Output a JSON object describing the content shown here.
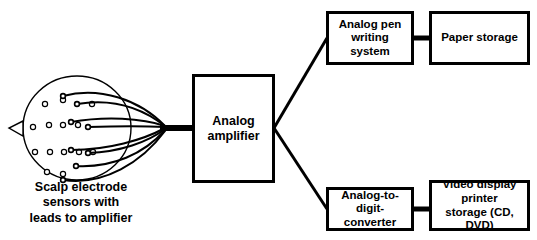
{
  "diagram": {
    "background_color": "#ffffff",
    "line_color": "#000000",
    "text_color": "#000000",
    "head": {
      "caption": "Scalp electrode\nsensors with\nleads to amplifier",
      "electrode_count": 14,
      "lead_count": 8,
      "nose_marker": "left-pointing-triangle"
    },
    "boxes": [
      {
        "id": "amplifier",
        "label": "Analog\namplifier"
      },
      {
        "id": "pen",
        "label": "Analog pen\nwriting system"
      },
      {
        "id": "paper",
        "label": "Paper storage"
      },
      {
        "id": "adc",
        "label": "Analog-to-digit-\nconverter"
      },
      {
        "id": "video",
        "label": "Video display\nprinter\nstorage (CD, DVD)"
      }
    ],
    "connections": [
      {
        "from": "scalp-electrodes",
        "to": "amplifier"
      },
      {
        "from": "amplifier",
        "to": "pen"
      },
      {
        "from": "pen",
        "to": "paper"
      },
      {
        "from": "amplifier",
        "to": "adc"
      },
      {
        "from": "adc",
        "to": "video"
      }
    ]
  }
}
